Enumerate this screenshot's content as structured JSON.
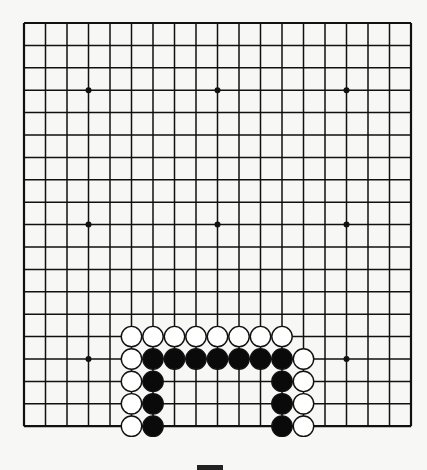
{
  "board": {
    "size": 19,
    "origin_x": 24,
    "origin_y": 23,
    "spacing_x": 21.5,
    "spacing_y": 22.4,
    "line_color": "#111111",
    "background": "#f7f7f5",
    "star_points": [
      [
        3,
        3
      ],
      [
        3,
        9
      ],
      [
        3,
        15
      ],
      [
        9,
        3
      ],
      [
        9,
        9
      ],
      [
        9,
        15
      ],
      [
        15,
        3
      ],
      [
        15,
        9
      ],
      [
        15,
        15
      ]
    ],
    "stones": [
      {
        "color": "white",
        "row": 14,
        "col": 5
      },
      {
        "color": "white",
        "row": 14,
        "col": 6
      },
      {
        "color": "white",
        "row": 14,
        "col": 7
      },
      {
        "color": "white",
        "row": 14,
        "col": 8
      },
      {
        "color": "white",
        "row": 14,
        "col": 9
      },
      {
        "color": "white",
        "row": 14,
        "col": 10
      },
      {
        "color": "white",
        "row": 14,
        "col": 11
      },
      {
        "color": "white",
        "row": 14,
        "col": 12
      },
      {
        "color": "white",
        "row": 15,
        "col": 5
      },
      {
        "color": "black",
        "row": 15,
        "col": 6
      },
      {
        "color": "black",
        "row": 15,
        "col": 7
      },
      {
        "color": "black",
        "row": 15,
        "col": 8
      },
      {
        "color": "black",
        "row": 15,
        "col": 9
      },
      {
        "color": "black",
        "row": 15,
        "col": 10
      },
      {
        "color": "black",
        "row": 15,
        "col": 11
      },
      {
        "color": "black",
        "row": 15,
        "col": 12
      },
      {
        "color": "white",
        "row": 15,
        "col": 13
      },
      {
        "color": "white",
        "row": 16,
        "col": 5
      },
      {
        "color": "black",
        "row": 16,
        "col": 6
      },
      {
        "color": "black",
        "row": 16,
        "col": 12
      },
      {
        "color": "white",
        "row": 16,
        "col": 13
      },
      {
        "color": "white",
        "row": 17,
        "col": 5
      },
      {
        "color": "black",
        "row": 17,
        "col": 6
      },
      {
        "color": "black",
        "row": 17,
        "col": 12
      },
      {
        "color": "white",
        "row": 17,
        "col": 13
      },
      {
        "color": "white",
        "row": 18,
        "col": 5
      },
      {
        "color": "black",
        "row": 18,
        "col": 6
      },
      {
        "color": "black",
        "row": 18,
        "col": 12
      },
      {
        "color": "white",
        "row": 18,
        "col": 13
      }
    ]
  }
}
